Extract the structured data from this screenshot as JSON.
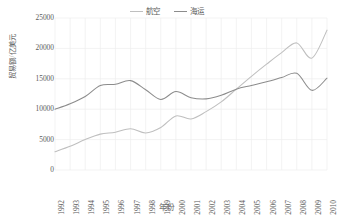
{
  "chart_data": {
    "type": "line",
    "title": "",
    "xlabel": "年份",
    "ylabel": "贸易额/亿美元",
    "xlim": [
      1992,
      2010
    ],
    "ylim": [
      0,
      25000
    ],
    "ytick_values": [
      0,
      5000,
      10000,
      15000,
      20000,
      25000
    ],
    "ytick_labels": [
      "0",
      "5000",
      "10000",
      "15000",
      "20000",
      "25000"
    ],
    "grid": true,
    "grid_axis": "both",
    "legend_position": "top-center",
    "smoothing": "spline",
    "categories": [
      "1992",
      "1993",
      "1994",
      "1995",
      "1996",
      "1997",
      "1998",
      "1999",
      "2000",
      "2001",
      "2002",
      "2003",
      "2004",
      "2005",
      "2006",
      "2007",
      "2008",
      "2009",
      "2010"
    ],
    "series": [
      {
        "name": "航空",
        "color": "#bfbfbf",
        "values": [
          3000,
          3900,
          5000,
          5900,
          6200,
          6800,
          6100,
          7000,
          8900,
          8400,
          9600,
          11200,
          13300,
          15400,
          17400,
          19300,
          20900,
          18400,
          23000
        ]
      },
      {
        "name": "海运",
        "color": "#8c8c8c",
        "values": [
          10000,
          10900,
          12100,
          13900,
          14100,
          14700,
          13200,
          11600,
          12900,
          11900,
          11700,
          12300,
          13300,
          13900,
          14500,
          15200,
          15900,
          13100,
          15100
        ]
      }
    ]
  },
  "legend": {
    "entries": [
      {
        "label": "航空",
        "swatch_icon": "line-swatch-icon",
        "color": "#bfbfbf"
      },
      {
        "label": "海运",
        "swatch_icon": "line-swatch-icon",
        "color": "#8c8c8c"
      }
    ]
  },
  "axes": {
    "y": {
      "title": "贸易额/亿美元",
      "ticks": [
        "25000",
        "20000",
        "15000",
        "10000",
        "5000",
        "0"
      ]
    },
    "x": {
      "title": "年份",
      "ticks": [
        "1992",
        "1993",
        "1994",
        "1995",
        "1996",
        "1997",
        "1998",
        "1999",
        "2000",
        "2001",
        "2002",
        "2003",
        "2004",
        "2005",
        "2006",
        "2007",
        "2008",
        "2009",
        "2010"
      ]
    }
  },
  "colors": {
    "text": "#5a5a5a",
    "grid": "#eeeeee",
    "background": "#ffffff",
    "series_aviation": "#bfbfbf",
    "series_maritime": "#8c8c8c"
  }
}
